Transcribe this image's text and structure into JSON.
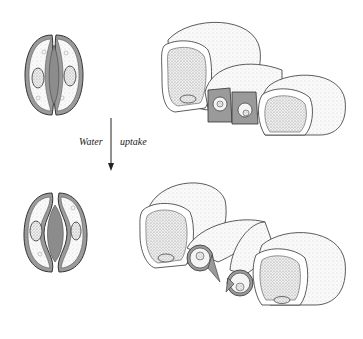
{
  "diagram": {
    "arrow_label_left": "Water",
    "arrow_label_right": "uptake",
    "panels": [
      {
        "name": "closed-stoma-surface-view",
        "state": "closed"
      },
      {
        "name": "closed-stoma-3d-section",
        "state": "closed"
      },
      {
        "name": "open-stoma-surface-view",
        "state": "open"
      },
      {
        "name": "open-stoma-3d-section",
        "state": "open"
      }
    ],
    "colors": {
      "outline": "#333333",
      "wall_fill": "#9a9a9a",
      "cytoplasm": "#f2f2f2",
      "pore": "#8c8c8c",
      "stipple": "#b5b5b5"
    }
  }
}
